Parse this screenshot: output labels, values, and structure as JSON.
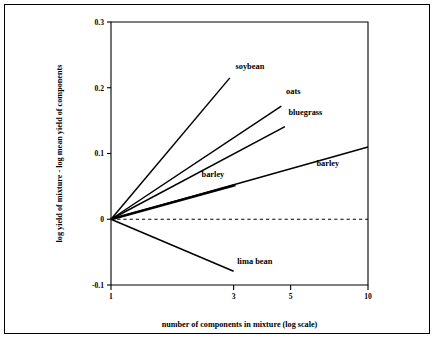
{
  "figure": {
    "frame": true
  },
  "chart_data": {
    "type": "line",
    "title": "",
    "xlabel": "number of components in mixture (log scale)",
    "ylabel": "log yield of mixture - log mean yield of components",
    "xscale": "log",
    "xlim": [
      1,
      10
    ],
    "ylim": [
      -0.1,
      0.3
    ],
    "grid": false,
    "legend": "inline-labels",
    "xticks": [
      1,
      3,
      5,
      10
    ],
    "xtick_labels": [
      "1",
      "3",
      "5",
      "10"
    ],
    "yticks": [
      -0.1,
      0,
      0.1,
      0.2,
      0.3
    ],
    "ytick_labels": [
      "-0.1",
      "0",
      "0.1",
      "0.2",
      "0.3"
    ],
    "reference_line": {
      "label": "zero reference",
      "y": 0,
      "style": "dashed",
      "x_start": 1,
      "x_end": 10
    },
    "series": [
      {
        "name": "soybean",
        "label": "soybean",
        "points": [
          [
            1,
            0
          ],
          [
            2.9,
            0.215
          ]
        ],
        "label_x": 3.05,
        "label_y": 0.228,
        "thick": false
      },
      {
        "name": "oats",
        "label": "oats",
        "points": [
          [
            1,
            0
          ],
          [
            4.6,
            0.172
          ]
        ],
        "label_x": 4.8,
        "label_y": 0.19,
        "thick": false
      },
      {
        "name": "bluegrass",
        "label": "bluegrass",
        "points": [
          [
            1,
            0
          ],
          [
            4.75,
            0.141
          ]
        ],
        "label_x": 4.9,
        "label_y": 0.158,
        "thick": false
      },
      {
        "name": "barley-short",
        "label": "barley",
        "points": [
          [
            1,
            0
          ],
          [
            3.05,
            0.052
          ]
        ],
        "label_x": 2.25,
        "label_y": 0.064,
        "thick": true
      },
      {
        "name": "barley-long",
        "label": "barley",
        "points": [
          [
            1,
            0
          ],
          [
            10,
            0.11
          ]
        ],
        "label_x": 6.3,
        "label_y": 0.081,
        "thick": false
      },
      {
        "name": "lima-bean",
        "label": "lima bean",
        "points": [
          [
            1,
            0
          ],
          [
            3.0,
            -0.079
          ]
        ],
        "label_x": 3.1,
        "label_y": -0.068,
        "thick": false
      }
    ]
  }
}
